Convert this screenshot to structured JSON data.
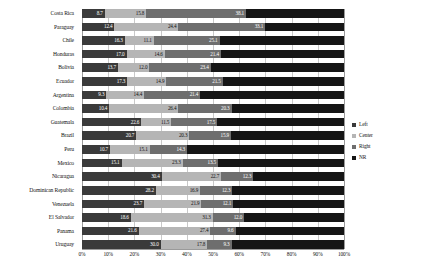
{
  "chart_data": {
    "type": "bar",
    "orientation": "horizontal",
    "stacked": true,
    "normalized_percent": true,
    "title": "",
    "subtitle": "",
    "xlabel": "",
    "ylabel": "",
    "xlim": [
      0,
      100
    ],
    "grid": true,
    "legend_position": "right",
    "xticks": [
      "0%",
      "10%",
      "20%",
      "30%",
      "40%",
      "50%",
      "60%",
      "70%",
      "80%",
      "90%",
      "100%"
    ],
    "xtick_values": [
      0,
      10,
      20,
      30,
      40,
      50,
      60,
      70,
      80,
      90,
      100
    ],
    "categories": [
      "Costa Rica",
      "Paraguay",
      "Chile",
      "Honduras",
      "Bolivia",
      "Ecuador",
      "Argentina",
      "Colombia",
      "Guatemala",
      "Brazil",
      "Peru",
      "Mexico",
      "Nicaragua",
      "Dominican Republic",
      "Venezuela",
      "El Salvador",
      "Panama",
      "Uruguay"
    ],
    "series": [
      {
        "name": "Left",
        "color": "#3a3a3a",
        "values": [
          8.7,
          12.4,
          16.3,
          17.0,
          13.7,
          17.3,
          9.3,
          10.4,
          22.6,
          20.7,
          10.7,
          15.1,
          30.4,
          28.2,
          23.7,
          18.6,
          21.6,
          30.0
        ]
      },
      {
        "name": "Center",
        "color": "#b5b5b5",
        "values": [
          15.8,
          24.4,
          11.1,
          14.6,
          12.0,
          14.9,
          14.4,
          26.4,
          11.5,
          20.3,
          15.1,
          23.3,
          22.7,
          16.9,
          21.9,
          31.3,
          27.4,
          17.8
        ]
      },
      {
        "name": "Right",
        "color": "#6e6e6e",
        "values": [
          38.1,
          33.1,
          25.1,
          21.4,
          23.4,
          21.5,
          21.4,
          20.3,
          17.5,
          15.9,
          14.3,
          13.5,
          12.3,
          12.3,
          12.1,
          12.0,
          9.6,
          9.3
        ]
      },
      {
        "name": "NR",
        "color": "#151515",
        "values": [
          37.4,
          30.1,
          47.5,
          47.0,
          50.9,
          46.3,
          54.9,
          42.9,
          48.4,
          43.1,
          59.9,
          48.1,
          34.6,
          42.6,
          42.3,
          38.1,
          41.4,
          42.9
        ]
      }
    ]
  },
  "legend": {
    "items": [
      {
        "label": "Left"
      },
      {
        "label": "Center"
      },
      {
        "label": "Right"
      },
      {
        "label": "NR"
      }
    ]
  }
}
